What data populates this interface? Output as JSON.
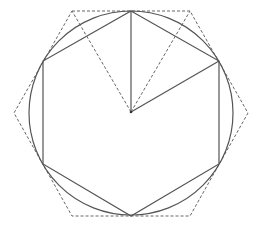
{
  "diagram": {
    "colors": {
      "background": "#ffffff",
      "stroke": "#555555",
      "dashed": "#666666"
    },
    "center": [
      131,
      112
    ],
    "circle": {
      "cx": 131,
      "cy": 113,
      "r": 102
    },
    "inscribed_hexagon": [
      [
        131,
        11
      ],
      [
        219,
        61
      ],
      [
        219,
        164
      ],
      [
        131,
        216
      ],
      [
        43,
        164
      ],
      [
        43,
        61
      ]
    ],
    "circumscribed_hexagon": [
      [
        72,
        11
      ],
      [
        190,
        11
      ],
      [
        248,
        113
      ],
      [
        190,
        216
      ],
      [
        72,
        216
      ],
      [
        14,
        113
      ]
    ],
    "radii": [
      [
        [
          131,
          112
        ],
        [
          131,
          11
        ]
      ],
      [
        [
          131,
          112
        ],
        [
          219,
          61
        ]
      ]
    ],
    "dashed_spokes": [
      [
        [
          131,
          112
        ],
        [
          72,
          11
        ]
      ],
      [
        [
          131,
          112
        ],
        [
          190,
          11
        ]
      ]
    ]
  }
}
